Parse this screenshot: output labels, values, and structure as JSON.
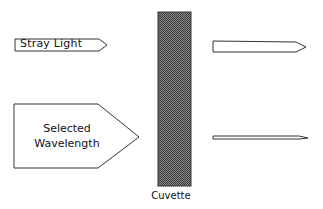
{
  "diagram": {
    "title": "",
    "labels": {
      "stray_light": "Stray Light",
      "selected_wavelength_line1": "Selected",
      "selected_wavelength_line2": "Wavelength",
      "cuvette": "Cuvette"
    },
    "colors": {
      "stroke": "#333333",
      "fill": "#ffffff",
      "cuvette_fill": "#6e6e6e"
    },
    "elements": [
      {
        "id": "stray-light-arrow-in",
        "type": "arrow",
        "label": "Stray Light"
      },
      {
        "id": "selected-wavelength-arrow-in",
        "type": "arrow",
        "label": "Selected Wavelength"
      },
      {
        "id": "cuvette",
        "type": "rectangle",
        "label": "Cuvette"
      },
      {
        "id": "stray-light-arrow-out",
        "type": "arrow",
        "label": ""
      },
      {
        "id": "transmitted-light-arrow-out",
        "type": "arrow",
        "label": ""
      }
    ]
  }
}
